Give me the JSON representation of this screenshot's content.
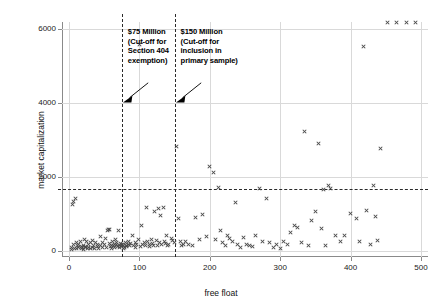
{
  "chart_data": {
    "type": "scatter",
    "title": "",
    "xlabel": "free float",
    "ylabel": "market capitalization",
    "xlim": [
      -10,
      510
    ],
    "ylim": [
      -150,
      6200
    ],
    "xticks": [
      0,
      100,
      200,
      300,
      400,
      500
    ],
    "yticks": [
      0,
      2000,
      4000,
      6000
    ],
    "grid": true,
    "legend": null,
    "marker": "x",
    "marker_color": "#4a4a4a",
    "reference_lines": [
      {
        "name": "cutoff-75m",
        "orientation": "vertical",
        "value": 75,
        "style": "dashed"
      },
      {
        "name": "cutoff-150m",
        "orientation": "vertical",
        "value": 150,
        "style": "dashed"
      },
      {
        "name": "market-cap-threshold",
        "orientation": "horizontal",
        "value": 1700,
        "style": "dashed"
      }
    ],
    "annotations": [
      {
        "name": "annotation-75-million",
        "lines": [
          "$75 Million",
          "(Cut-off for",
          "Section 404",
          "exemption)"
        ],
        "points_to_x": 75,
        "points_to_y": 4050
      },
      {
        "name": "annotation-150-million",
        "lines": [
          "$150 Million",
          "(Cut-off for",
          "inclusion in",
          "primary sample)"
        ],
        "points_to_x": 150,
        "points_to_y": 4050
      }
    ],
    "x": [
      3,
      4,
      5,
      6,
      7,
      8,
      9,
      10,
      11,
      12,
      13,
      14,
      16,
      17,
      18,
      19,
      20,
      21,
      22,
      23,
      24,
      25,
      26,
      27,
      28,
      30,
      31,
      33,
      34,
      35,
      36,
      38,
      40,
      41,
      42,
      44,
      45,
      47,
      48,
      50,
      52,
      53,
      55,
      56,
      57,
      58,
      59,
      60,
      61,
      62,
      63,
      64,
      65,
      66,
      67,
      68,
      69,
      70,
      71,
      72,
      73,
      74,
      75,
      76,
      77,
      78,
      79,
      80,
      81,
      82,
      84,
      85,
      86,
      88,
      90,
      92,
      94,
      95,
      96,
      98,
      100,
      101,
      103,
      105,
      107,
      108,
      110,
      112,
      114,
      115,
      117,
      119,
      120,
      122,
      124,
      125,
      127,
      128,
      130,
      132,
      134,
      135,
      137,
      139,
      140,
      142,
      145,
      147,
      150,
      152,
      155,
      158,
      160,
      163,
      166,
      170,
      175,
      180,
      185,
      190,
      195,
      200,
      205,
      208,
      212,
      215,
      218,
      222,
      225,
      228,
      232,
      236,
      240,
      244,
      248,
      252,
      256,
      260,
      265,
      270,
      275,
      280,
      285,
      290,
      295,
      300,
      305,
      310,
      315,
      320,
      325,
      330,
      335,
      340,
      345,
      350,
      355,
      358,
      362,
      365,
      368,
      372,
      378,
      385,
      392,
      400,
      408,
      412,
      418,
      422,
      428,
      432,
      435,
      438,
      442,
      452,
      465,
      480,
      492
    ],
    "y": [
      120,
      60,
      1280,
      1350,
      180,
      90,
      1420,
      230,
      70,
      150,
      110,
      200,
      260,
      80,
      130,
      100,
      170,
      60,
      310,
      95,
      140,
      260,
      75,
      190,
      120,
      230,
      90,
      300,
      110,
      160,
      70,
      250,
      130,
      200,
      85,
      410,
      150,
      100,
      230,
      190,
      340,
      120,
      560,
      600,
      580,
      210,
      130,
      170,
      90,
      260,
      150,
      200,
      110,
      320,
      180,
      240,
      130,
      560,
      160,
      100,
      220,
      140,
      180,
      200,
      150,
      90,
      110,
      230,
      170,
      130,
      260,
      190,
      150,
      210,
      430,
      170,
      250,
      120,
      200,
      310,
      5600,
      140,
      700,
      180,
      230,
      150,
      1180,
      260,
      190,
      130,
      310,
      210,
      170,
      1080,
      290,
      150,
      1160,
      230,
      960,
      190,
      1200,
      270,
      210,
      420,
      150,
      190,
      340,
      300,
      230,
      2830,
      900,
      280,
      150,
      200,
      260,
      180,
      170,
      920,
      320,
      1010,
      400,
      2290,
      2120,
      310,
      1720,
      560,
      230,
      170,
      430,
      350,
      260,
      1330,
      180,
      120,
      380,
      200,
      150,
      140,
      420,
      1710,
      280,
      1440,
      250,
      120,
      200,
      90,
      260,
      190,
      520,
      700,
      640,
      230,
      3230,
      160,
      830,
      1080,
      2920,
      620,
      1670,
      150,
      1780,
      1690,
      440,
      260,
      420,
      1020,
      880,
      280,
      5540,
      1120,
      190,
      1780,
      940,
      300,
      2780
    ]
  }
}
